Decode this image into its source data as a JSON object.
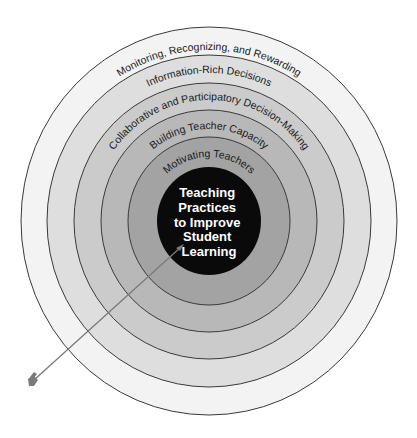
{
  "diagram": {
    "type": "concentric-target",
    "core": {
      "lines": [
        "Teaching",
        "Practices",
        "to Improve",
        "Student",
        "Learning"
      ],
      "fill": "#0a0a0a",
      "text_color": "#ffffff"
    },
    "rings": [
      {
        "label": "Motivating Teachers",
        "fill": "#a3a3a3"
      },
      {
        "label": "Building Teacher Capacity",
        "fill": "#b8b8b8"
      },
      {
        "label": "Collaborative and Participatory Decision-Making",
        "fill": "#cbcbcb"
      },
      {
        "label": "Information-Rich Decisions",
        "fill": "#dedede"
      },
      {
        "label": "Monitoring, Recognizing, and Rewarding",
        "fill": "#f3f3f3"
      }
    ],
    "arrow": {
      "from": "outside-lower-left",
      "to": "core",
      "color": "#7a7a7a"
    },
    "border_color": "#3a3a3a"
  }
}
